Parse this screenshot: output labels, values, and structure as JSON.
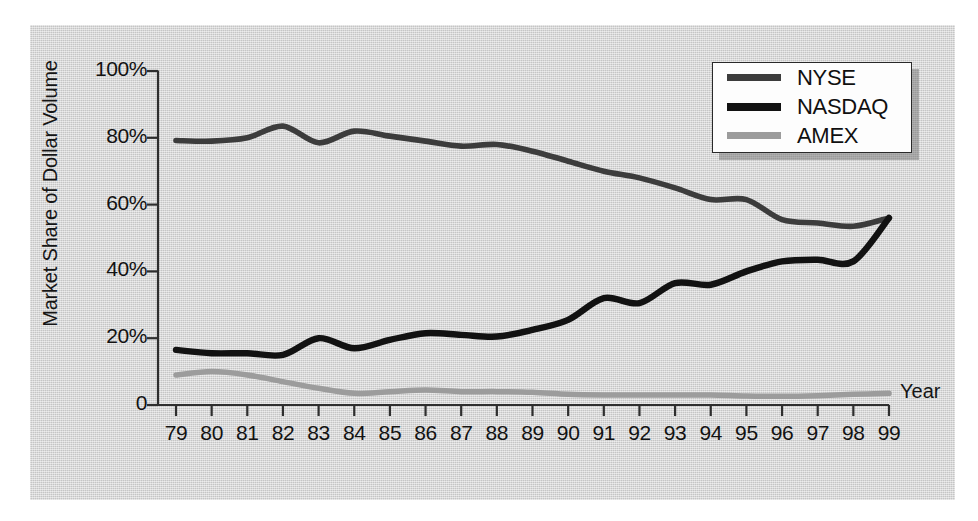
{
  "chart_data": {
    "type": "line",
    "title": "",
    "xlabel": "Year",
    "ylabel": "Market Share of Dollar Volume",
    "x": [
      79,
      80,
      81,
      82,
      83,
      84,
      85,
      86,
      87,
      88,
      89,
      90,
      91,
      92,
      93,
      94,
      95,
      96,
      97,
      98,
      99
    ],
    "xtick_labels": [
      "79",
      "80",
      "81",
      "82",
      "83",
      "84",
      "85",
      "86",
      "87",
      "88",
      "89",
      "90",
      "91",
      "92",
      "93",
      "94",
      "95",
      "96",
      "97",
      "98",
      "99"
    ],
    "ytick_labels": [
      "0",
      "20%",
      "40%",
      "60%",
      "80%",
      "100%"
    ],
    "ytick_values": [
      0,
      20,
      40,
      60,
      80,
      100
    ],
    "ylim": [
      0,
      100
    ],
    "xlim": [
      79,
      99
    ],
    "grid": false,
    "legend_position": "top-right",
    "series": [
      {
        "name": "NYSE",
        "color": "#3c3c3c",
        "values": [
          79.2,
          79.0,
          80.0,
          83.5,
          78.5,
          82.0,
          80.5,
          79.0,
          77.5,
          78.0,
          76.0,
          73.0,
          70.0,
          68.0,
          65.0,
          61.5,
          61.5,
          55.5,
          54.5,
          53.5,
          56.0
        ]
      },
      {
        "name": "NASDAQ",
        "color": "#121212",
        "values": [
          16.5,
          15.5,
          15.5,
          15.0,
          20.0,
          17.0,
          19.5,
          21.5,
          21.0,
          20.5,
          22.5,
          25.5,
          32.0,
          30.5,
          36.5,
          36.0,
          40.0,
          43.0,
          43.5,
          43.0,
          56.0
        ]
      },
      {
        "name": "AMEX",
        "color": "#9c9c9c",
        "values": [
          9.0,
          10.0,
          9.0,
          7.0,
          5.0,
          3.5,
          4.0,
          4.5,
          4.0,
          4.0,
          3.8,
          3.2,
          3.0,
          3.0,
          3.0,
          3.0,
          2.7,
          2.6,
          2.8,
          3.2,
          3.5
        ]
      }
    ]
  },
  "legend": {
    "items": [
      {
        "label": "NYSE"
      },
      {
        "label": "NASDAQ"
      },
      {
        "label": "AMEX"
      }
    ]
  }
}
